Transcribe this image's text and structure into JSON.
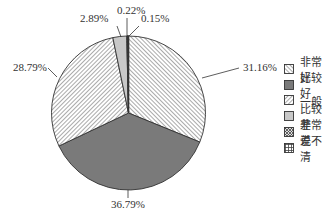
{
  "chart_data": {
    "type": "pie",
    "title": "",
    "start_angle": "12 o'clock, clockwise",
    "categories": [
      "非常好",
      "比较好",
      "一般",
      "比较差",
      "非常差",
      "说不清"
    ],
    "values": [
      31.16,
      36.79,
      28.79,
      2.89,
      0.22,
      0.15
    ],
    "labels": [
      "31.16%",
      "36.79%",
      "28.79%",
      "2.89%",
      "0.22%",
      "0.15%"
    ],
    "fills": [
      "hatch-back-diagonal",
      "solid-dark-gray",
      "hatch-forward-diagonal",
      "solid-light-gray",
      "crosshatch",
      "grid"
    ],
    "colors": {
      "dark_gray": "#7a7a7a",
      "light_gray": "#c8c8c8",
      "outline": "#333333",
      "hatch": "#555555"
    },
    "legend_position": "right",
    "legend": [
      {
        "label": "非常好",
        "fill": "hatch-back-diagonal"
      },
      {
        "label": "比较好",
        "fill": "solid-dark-gray"
      },
      {
        "label": "一般",
        "fill": "hatch-forward-diagonal"
      },
      {
        "label": "比较差",
        "fill": "solid-light-gray"
      },
      {
        "label": "非常差",
        "fill": "crosshatch"
      },
      {
        "label": "说不清",
        "fill": "grid"
      }
    ]
  }
}
